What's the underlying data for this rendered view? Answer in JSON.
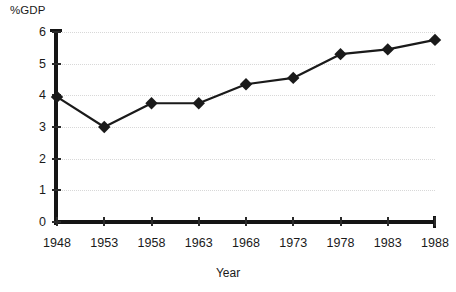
{
  "chart_data": {
    "type": "line",
    "title": "",
    "xlabel": "Year",
    "ylabel": "%GDP",
    "categories": [
      "1948",
      "1953",
      "1958",
      "1963",
      "1968",
      "1973",
      "1978",
      "1983",
      "1988"
    ],
    "x": [
      1948,
      1953,
      1958,
      1963,
      1968,
      1973,
      1978,
      1983,
      1988
    ],
    "values": [
      3.95,
      3.0,
      3.75,
      3.75,
      4.35,
      4.55,
      5.3,
      5.45,
      5.75
    ],
    "series": [
      {
        "name": "%GDP",
        "values": [
          3.95,
          3.0,
          3.75,
          3.75,
          4.35,
          4.55,
          5.3,
          5.45,
          5.75
        ]
      }
    ],
    "ylim": [
      0,
      6
    ],
    "yticks": [
      0,
      1,
      2,
      3,
      4,
      5,
      6
    ],
    "ytick_labels": [
      "0",
      "1",
      "2",
      "3",
      "4",
      "5",
      "6"
    ],
    "xtick_labels": [
      "1948",
      "1953",
      "1958",
      "1963",
      "1968",
      "1973",
      "1978",
      "1983",
      "1988"
    ],
    "grid": "horizontal-dotted",
    "legend": "none",
    "marker": "diamond",
    "line_color": "#1a1a1a",
    "marker_color": "#1a1a1a",
    "grid_color": "#d8d8d8",
    "axis_color": "#151515",
    "background": "#ffffff"
  }
}
